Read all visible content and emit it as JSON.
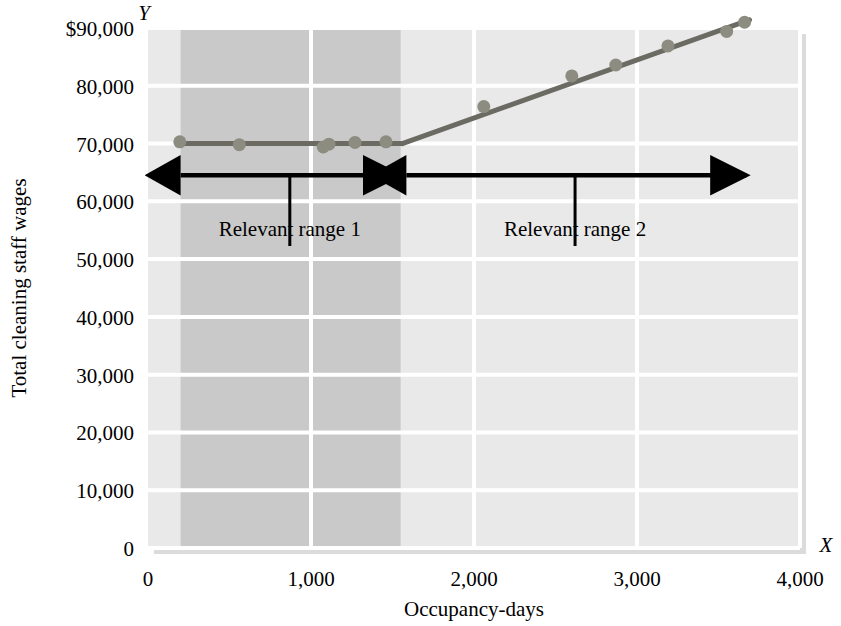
{
  "chart_data": {
    "type": "line",
    "title": "",
    "xlabel": "Occupancy-days",
    "ylabel": "Total cleaning staff wages",
    "x_axis_letter": "X",
    "y_axis_letter": "Y",
    "xlim": [
      0,
      4000
    ],
    "ylim": [
      0,
      90000
    ],
    "xticks": [
      0,
      1000,
      2000,
      3000,
      4000
    ],
    "xtick_labels": [
      "0",
      "1,000",
      "2,000",
      "3,000",
      "4,000"
    ],
    "yticks": [
      0,
      10000,
      20000,
      30000,
      40000,
      50000,
      60000,
      70000,
      80000,
      90000
    ],
    "ytick_labels": [
      "0",
      "10,000",
      "20,000",
      "30,000",
      "40,000",
      "50,000",
      "60,000",
      "70,000",
      "80,000",
      "$90,000"
    ],
    "grid": true,
    "legend": "none",
    "series": [
      {
        "name": "Step cost line - relevant range 1 (flat)",
        "type": "line",
        "color": "#6b6b63",
        "points": [
          [
            180,
            70000
          ],
          [
            1560,
            70000
          ]
        ]
      },
      {
        "name": "Step cost line - relevant range 2 (rising)",
        "type": "line",
        "color": "#6b6b63",
        "points": [
          [
            1560,
            70000
          ],
          [
            3690,
            91400
          ]
        ]
      }
    ],
    "scatter": {
      "name": "Observed cost points",
      "color": "#8c8c80",
      "marker": "circle",
      "points": [
        [
          195,
          70300
        ],
        [
          560,
          69800
        ],
        [
          1075,
          69400
        ],
        [
          1110,
          69900
        ],
        [
          1270,
          70200
        ],
        [
          1460,
          70300
        ],
        [
          2060,
          76400
        ],
        [
          2600,
          81700
        ],
        [
          2870,
          83600
        ],
        [
          3190,
          86900
        ],
        [
          3550,
          89400
        ],
        [
          3660,
          91000
        ]
      ]
    },
    "shaded_bands": [
      {
        "name": "relevant-range-1-band",
        "x_from": 200,
        "x_to": 1550,
        "color": "#c9c9c9"
      },
      {
        "name": "plot-background",
        "color": "#e9e9e9"
      }
    ],
    "annotations": [
      {
        "name": "relevant-range-1",
        "label": "Relevant range 1",
        "arrow_from_x": 200,
        "arrow_to_x": 1540,
        "arrow_y": 64500,
        "leader_x": 870,
        "label_x": 870,
        "label_y": 54000
      },
      {
        "name": "relevant-range-2",
        "label": "Relevant range 2",
        "arrow_from_x": 1585,
        "arrow_to_x": 3670,
        "arrow_y": 64500,
        "leader_x": 2620,
        "label_x": 2620,
        "label_y": 54000
      }
    ],
    "colors": {
      "plot_background": "#e9e9e9",
      "band_dark": "#c9c9c9",
      "gridline": "#ffffff",
      "line": "#6b6b63",
      "marker": "#8c8c80",
      "annotation": "#000000",
      "text": "#000000"
    }
  }
}
